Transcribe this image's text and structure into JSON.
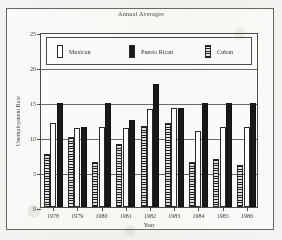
{
  "chart_data": {
    "type": "bar",
    "title": "Annual Averages",
    "xlabel": "Year",
    "ylabel": "Unemployment Rate",
    "categories": [
      "1978",
      "1979",
      "1980",
      "1981",
      "1982",
      "1983",
      "1984",
      "1985",
      "1986"
    ],
    "ylim": [
      0,
      25
    ],
    "yticks": [
      0,
      5,
      10,
      15,
      20,
      25
    ],
    "grid": true,
    "legend_position": "top-inside",
    "series": [
      {
        "name": "Cuban",
        "pattern": "horizontal-stripes",
        "color": "#1f1d1b",
        "values": [
          7.6,
          10.0,
          6.5,
          9.0,
          11.6,
          12.0,
          6.5,
          6.8,
          6.0
        ]
      },
      {
        "name": "Mexican",
        "pattern": "solid-white",
        "color": "#ffffff",
        "values": [
          12.0,
          11.3,
          11.5,
          11.3,
          14.0,
          14.2,
          10.8,
          11.4,
          11.4
        ]
      },
      {
        "name": "Puerto Rican",
        "pattern": "solid-black",
        "color": "#1b1917",
        "values": [
          14.9,
          11.4,
          14.9,
          12.5,
          17.6,
          14.2,
          14.9,
          14.9,
          14.9
        ]
      }
    ],
    "legend_order": [
      "Mexican",
      "Puerto Rican",
      "Cuban"
    ],
    "bar_order_in_group": [
      "Cuban",
      "Mexican",
      "Puerto Rican"
    ]
  }
}
